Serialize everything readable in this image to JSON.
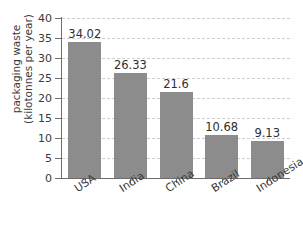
{
  "chart_data": {
    "type": "bar",
    "title": "",
    "subtitle": "",
    "xlabel": "",
    "ylabel": "packaging waste (kilotonnes per year)",
    "ylabel_lines": [
      "packaging waste",
      "(kilotonnes per year)"
    ],
    "categories": [
      "USA",
      "India",
      "China",
      "Brazil",
      "Indonesia"
    ],
    "values": [
      34.02,
      26.33,
      21.6,
      10.68,
      9.13
    ],
    "value_labels": [
      "34.02",
      "26.33",
      "21.6",
      "10.68",
      "9.13"
    ],
    "ylim": [
      0,
      40
    ],
    "y_ticks": [
      0,
      5,
      10,
      15,
      20,
      25,
      30,
      35,
      40
    ],
    "y_tick_labels": [
      "0",
      "5",
      "10",
      "15",
      "20",
      "25",
      "30",
      "35",
      "40"
    ],
    "grid": true,
    "grid_axis": "y",
    "grid_style": "dashed",
    "legend": false,
    "legend_position": "none",
    "colors": {
      "bar": "#8c8c8c",
      "axis": "#6d6d6d",
      "grid": "#cfcfcf",
      "text": "#3a3a3a",
      "value_text": "#2f2f2f",
      "background": "#ffffff"
    }
  }
}
